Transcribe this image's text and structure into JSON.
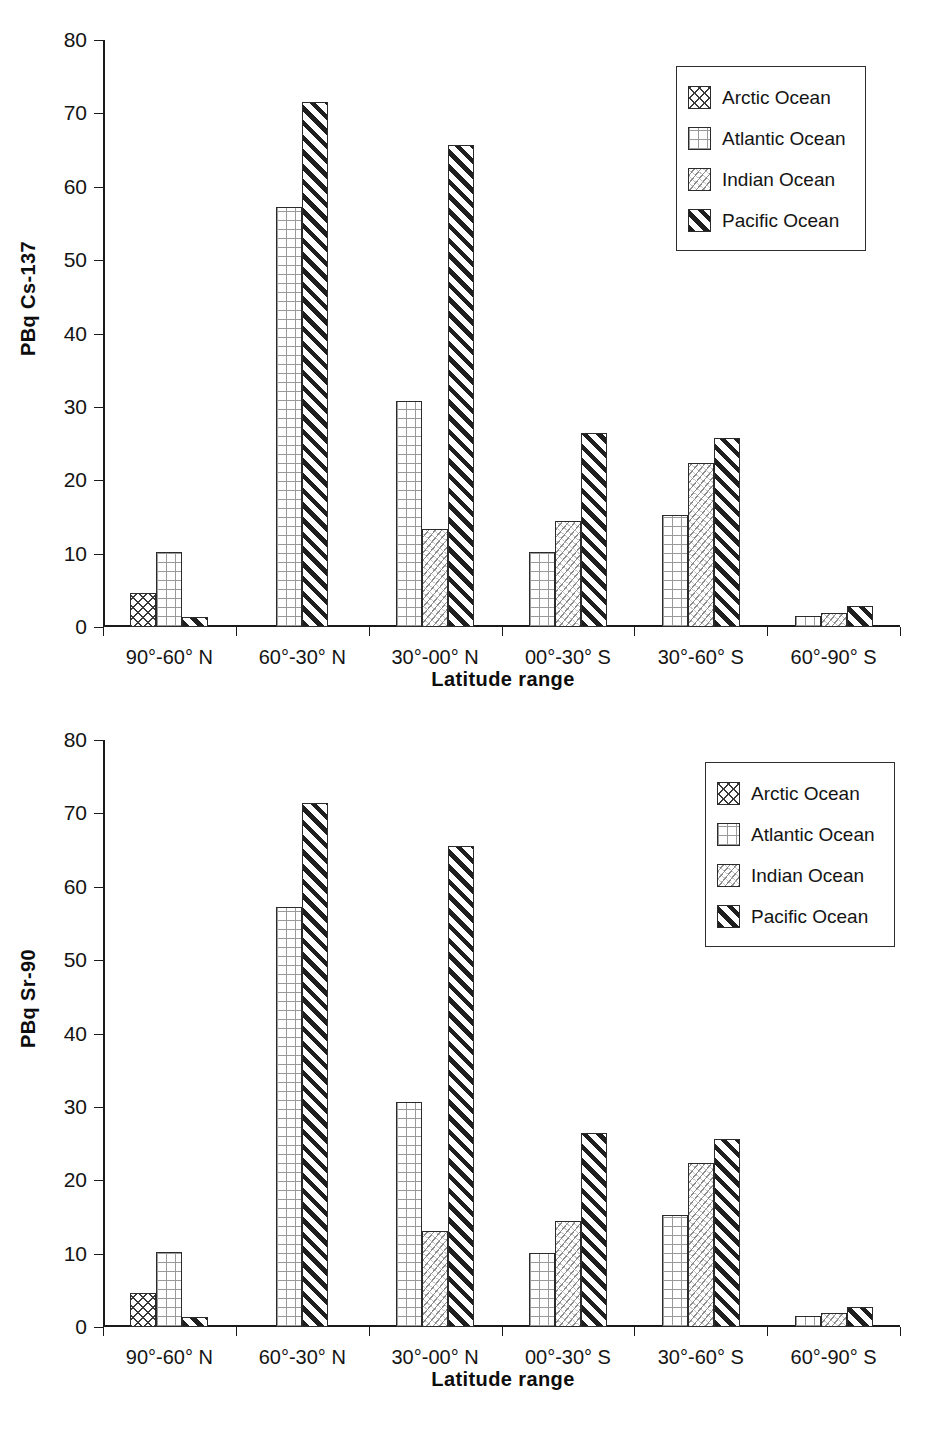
{
  "chart_data": [
    {
      "type": "bar",
      "title": "",
      "xlabel": "Latitude range",
      "ylabel": "PBq Cs-137",
      "ylim": [
        0,
        80
      ],
      "yticks": [
        0,
        10,
        20,
        30,
        40,
        50,
        60,
        70,
        80
      ],
      "grid": false,
      "legend_position": "top-right",
      "categories": [
        "90°-60° N",
        "60°-30° N",
        "30°-00° N",
        "00°-30° S",
        "30°-60° S",
        "60°-90° S"
      ],
      "series": [
        {
          "name": "Arctic Ocean",
          "values": [
            4.6,
            0,
            0,
            0,
            0,
            0
          ]
        },
        {
          "name": "Atlantic Ocean",
          "values": [
            10.2,
            57.3,
            30.8,
            10.2,
            15.3,
            1.5
          ]
        },
        {
          "name": "Indian Ocean",
          "values": [
            0,
            0,
            13.3,
            14.5,
            22.3,
            1.9
          ]
        },
        {
          "name": "Pacific Ocean",
          "values": [
            1.3,
            71.5,
            65.7,
            26.4,
            25.7,
            2.8
          ]
        }
      ]
    },
    {
      "type": "bar",
      "title": "",
      "xlabel": "Latitude range",
      "ylabel": "PBq Sr-90",
      "ylim": [
        0,
        80
      ],
      "yticks": [
        0,
        10,
        20,
        30,
        40,
        50,
        60,
        70,
        80
      ],
      "grid": false,
      "legend_position": "top-right",
      "categories": [
        "90°-60° N",
        "60°-30° N",
        "30°-00° N",
        "00°-30° S",
        "30°-60° S",
        "60°-90° S"
      ],
      "series": [
        {
          "name": "Arctic Ocean",
          "values": [
            4.6,
            0,
            0,
            0,
            0,
            0
          ]
        },
        {
          "name": "Atlantic Ocean",
          "values": [
            10.2,
            57.3,
            30.7,
            10.1,
            15.2,
            1.5
          ]
        },
        {
          "name": "Indian Ocean",
          "values": [
            0,
            0,
            13.1,
            14.4,
            22.3,
            1.9
          ]
        },
        {
          "name": "Pacific Ocean",
          "values": [
            1.3,
            71.4,
            65.6,
            26.4,
            25.6,
            2.7
          ]
        }
      ]
    }
  ],
  "series_patterns": {
    "Arctic Ocean": "pat-arctic",
    "Atlantic Ocean": "pat-atlantic",
    "Indian Ocean": "pat-indian",
    "Pacific Ocean": "pat-pacific"
  },
  "colors": {
    "axis": "#1a1a1a",
    "text": "#141414",
    "bar_outline": "#2b2b2b",
    "background": "#ffffff"
  }
}
